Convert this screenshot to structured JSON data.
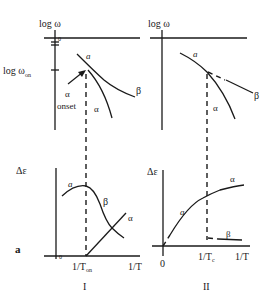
{
  "figure": {
    "panel_letter": "a",
    "columns": [
      {
        "id": "I",
        "label": "I",
        "top_plot": {
          "y_axis_label": "log ω",
          "y_tick_label": "log ω",
          "y_tick_sub": "on",
          "curve_labels": {
            "a": "a",
            "beta": "β",
            "alpha": "α"
          },
          "annotation_line1": "α",
          "annotation_line2": "onset"
        },
        "bottom_plot": {
          "y_axis_label": "Δε",
          "origin_label": "0",
          "x_tick_label": "1/T",
          "x_tick_sub": "on",
          "x_axis_label": "1/T",
          "curve_labels": {
            "a": "a",
            "beta": "β",
            "alpha": "α"
          }
        }
      },
      {
        "id": "II",
        "label": "II",
        "top_plot": {
          "y_axis_label": "log ω",
          "curve_labels": {
            "a": "a",
            "beta": "β",
            "alpha": "α"
          }
        },
        "bottom_plot": {
          "y_axis_label": "Δε",
          "origin_label": "0",
          "x_tick_label": "1/T",
          "x_tick_sub": "c",
          "x_axis_label": "1/T",
          "curve_labels": {
            "a": "a",
            "beta": "β",
            "alpha": "α"
          }
        }
      }
    ]
  }
}
